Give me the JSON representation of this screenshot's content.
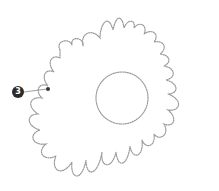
{
  "diagram": {
    "style": "dotted stitched outline",
    "outline_color": "#9a9a9a",
    "callouts": [
      {
        "number": "3",
        "badge_color": "#2b2b2b",
        "target": "outer-petal-edge-left"
      }
    ]
  }
}
